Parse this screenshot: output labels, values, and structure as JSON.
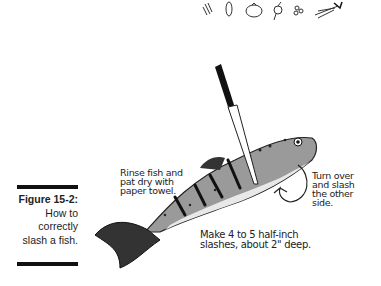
{
  "header_icons": [
    "celery-icon",
    "bean-icon",
    "tomato-icon",
    "radish-icon",
    "peas-icon",
    "carrot-icon"
  ],
  "figure": {
    "number": "Figure 15-2:",
    "caption_lines": [
      "How to",
      "correctly",
      "slash a fish."
    ]
  },
  "annotations": {
    "rinse": [
      "Rinse fish and",
      "pat dry with",
      "paper towel."
    ],
    "turn": [
      "Turn over",
      "and slash",
      "the other",
      "side."
    ],
    "make": [
      "Make 4 to 5 half-inch",
      "slashes, about 2\" deep."
    ]
  }
}
